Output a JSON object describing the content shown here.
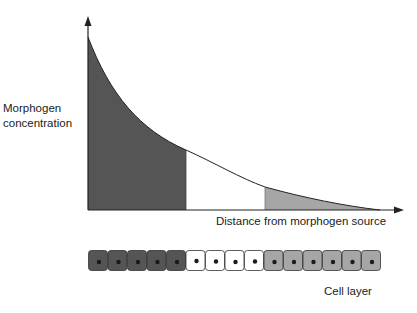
{
  "diagram": {
    "y_axis_label_line1": "Morphogen",
    "y_axis_label_line2": "concentration",
    "x_axis_label": "Distance from morphogen source",
    "cell_layer_label": "Cell layer",
    "colors": {
      "high_region": "#555555",
      "mid_region": "#ffffff",
      "low_region": "#a6a6a6",
      "axis": "#222222",
      "nucleus": "#1a1a1a"
    },
    "regions": [
      {
        "name": "high",
        "cells": 5,
        "color": "#555555"
      },
      {
        "name": "mid",
        "cells": 4,
        "color": "#ffffff"
      },
      {
        "name": "low",
        "cells": 6,
        "color": "#a6a6a6"
      }
    ],
    "total_cells": 15
  }
}
